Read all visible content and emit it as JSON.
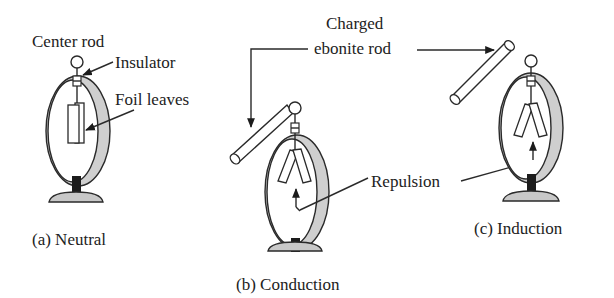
{
  "figure": {
    "type": "electroscope-diagram",
    "panels": [
      {
        "id": "a",
        "caption": "(a) Neutral",
        "state": "leaves-hanging-together",
        "labels": {
          "center_rod": "Center rod",
          "insulator": "Insulator",
          "foil_leaves": "Foil leaves"
        }
      },
      {
        "id": "b",
        "caption": "(b) Conduction",
        "state": "rod-touching-ball-leaves-spread"
      },
      {
        "id": "c",
        "caption": "(c) Induction",
        "state": "rod-near-ball-leaves-spread"
      }
    ],
    "shared_labels": {
      "charged_line1": "Charged",
      "charged_line2": "ebonite rod",
      "repulsion": "Repulsion"
    },
    "colors": {
      "line": "#2a2a2a",
      "ring_fill": "#cfcfcf",
      "base_fill": "#c8c8c8",
      "stem_fill": "#1c1c1c",
      "background": "#ffffff"
    }
  }
}
